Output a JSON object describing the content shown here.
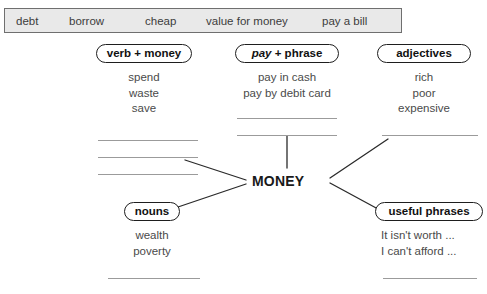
{
  "worksheet": {
    "center_node": "MONEY",
    "word_bank": {
      "name": "word-bank",
      "items": [
        "debt",
        "borrow",
        "cheap",
        "value for money",
        "pay a bill"
      ]
    },
    "branches": [
      {
        "id": "verb-money",
        "label_plain": "verb + money",
        "label_italic_part": "",
        "label_rest": "verb + money",
        "items": [
          "spend",
          "waste",
          "save"
        ],
        "blank_lines": 3,
        "align": "center"
      },
      {
        "id": "pay-phrase",
        "label_plain": "pay + phrase",
        "label_italic_part": "pay",
        "label_rest": " + phrase",
        "items": [
          "pay in cash",
          "pay by debit card"
        ],
        "blank_lines": 2,
        "align": "center"
      },
      {
        "id": "adjectives",
        "label_plain": "adjectives",
        "label_italic_part": "",
        "label_rest": "adjectives",
        "items": [
          "rich",
          "poor",
          "expensive"
        ],
        "blank_lines": 1,
        "align": "center"
      },
      {
        "id": "nouns",
        "label_plain": "nouns",
        "label_italic_part": "",
        "label_rest": "nouns",
        "items": [
          "wealth",
          "poverty"
        ],
        "blank_lines": 1,
        "align": "center"
      },
      {
        "id": "useful-phrases",
        "label_plain": "useful phrases",
        "label_italic_part": "",
        "label_rest": "useful phrases",
        "items": [
          "It isn't worth ...",
          "I can't afford ..."
        ],
        "blank_lines": 1,
        "align": "left"
      }
    ],
    "colors": {
      "word_bank_fill": "#e9e9e9",
      "word_bank_border": "#6f6f6f",
      "pill_border": "#1e1e1e",
      "rule_line": "#9b9b9b",
      "connector_line": "#2a2a2a",
      "item_text": "#4a4a4a",
      "center_text": "#1a1a1a"
    }
  }
}
